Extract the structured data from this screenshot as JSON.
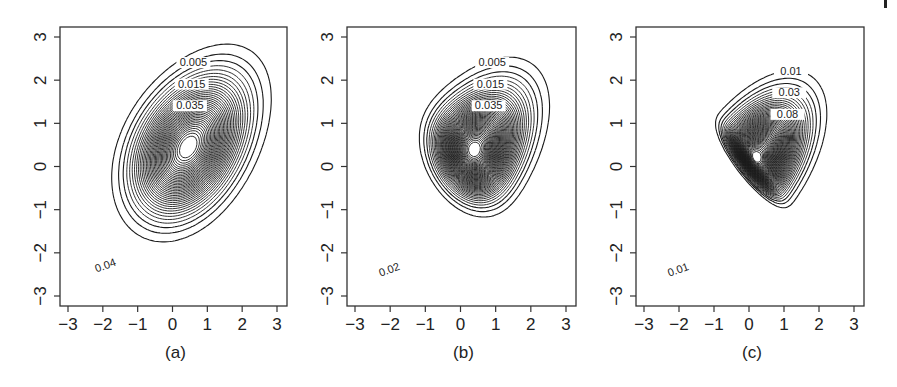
{
  "figure": {
    "panels": [
      {
        "id": "a",
        "caption": "(a)"
      },
      {
        "id": "b",
        "caption": "(b)"
      },
      {
        "id": "c",
        "caption": "(c)"
      }
    ]
  },
  "chart_data": [
    {
      "type": "contour",
      "title": "",
      "caption": "(a)",
      "xlabel": "",
      "ylabel": "",
      "xlim": [
        -3.2,
        3.2
      ],
      "ylim": [
        -3.2,
        3.2
      ],
      "xticks": [
        -3,
        -2,
        -1,
        0,
        1,
        2,
        3
      ],
      "yticks": [
        -3,
        -2,
        -1,
        0,
        1,
        2,
        3
      ],
      "grid": false,
      "mode": [
        0.0,
        0.0
      ],
      "contour_labels": [
        "0.005",
        "0.015",
        "0.035",
        "0.09",
        "0.115",
        "0.05",
        "0.08",
        "0.03",
        "0.025",
        "0.02",
        "0.01",
        "0.1",
        "0.04"
      ],
      "levels": [
        0.005,
        0.01,
        0.015,
        0.02,
        0.025,
        0.03,
        0.035,
        0.04,
        0.05,
        0.08,
        0.09,
        0.1,
        0.115
      ],
      "outer_extent": {
        "x": [
          -2.8,
          2.7
        ],
        "y": [
          -2.9,
          2.6
        ]
      }
    },
    {
      "type": "contour",
      "title": "",
      "caption": "(b)",
      "xlabel": "",
      "ylabel": "",
      "xlim": [
        -3.2,
        3.2
      ],
      "ylim": [
        -3.2,
        3.2
      ],
      "xticks": [
        -3,
        -2,
        -1,
        0,
        1,
        2,
        3
      ],
      "yticks": [
        -3,
        -2,
        -1,
        0,
        1,
        2,
        3
      ],
      "grid": false,
      "mode": [
        0.3,
        0.3
      ],
      "contour_labels": [
        "0.005",
        "0.015",
        "0.035",
        "0.09",
        "0.105",
        "0.055",
        "0.03",
        "0.01",
        "0.02"
      ],
      "levels": [
        0.005,
        0.01,
        0.015,
        0.02,
        0.03,
        0.035,
        0.055,
        0.09,
        0.105
      ],
      "outer_extent": {
        "x": [
          -2.9,
          2.7
        ],
        "y": [
          -3.0,
          2.6
        ]
      }
    },
    {
      "type": "contour",
      "title": "",
      "caption": "(c)",
      "xlabel": "",
      "ylabel": "",
      "xlim": [
        -3.2,
        3.2
      ],
      "ylim": [
        -3.2,
        3.2
      ],
      "xticks": [
        -3,
        -2,
        -1,
        0,
        1,
        2,
        3
      ],
      "yticks": [
        -3,
        -2,
        -1,
        0,
        1,
        2,
        3
      ],
      "grid": false,
      "mode": [
        0.6,
        0.6
      ],
      "contour_labels": [
        "0.01",
        "0.03",
        "0.08",
        "0.07",
        "0.02",
        "0.01"
      ],
      "levels": [
        0.01,
        0.02,
        0.03,
        0.07,
        0.08
      ],
      "outer_extent": {
        "x": [
          -2.9,
          2.5
        ],
        "y": [
          -3.0,
          2.4
        ]
      }
    }
  ]
}
